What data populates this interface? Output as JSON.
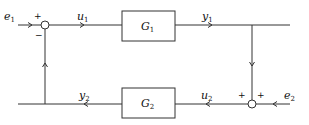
{
  "diagram": {
    "type": "feedback-loop block diagram",
    "blocks": [
      {
        "id": "G1",
        "label": "G",
        "subscript": "1"
      },
      {
        "id": "G2",
        "label": "G",
        "subscript": "2"
      }
    ],
    "signals": {
      "e1": {
        "label": "e",
        "subscript": "1"
      },
      "u1": {
        "label": "u",
        "subscript": "1"
      },
      "y1": {
        "label": "y",
        "subscript": "1"
      },
      "e2": {
        "label": "e",
        "subscript": "2"
      },
      "u2": {
        "label": "u",
        "subscript": "2"
      },
      "y2": {
        "label": "y",
        "subscript": "2"
      }
    },
    "junctions": {
      "sum1": {
        "signs": {
          "e1": "+",
          "feedback": "−"
        }
      },
      "sum2": {
        "signs": {
          "y1": "+",
          "e2": "+"
        }
      }
    },
    "colors": {
      "line": "#333333",
      "text": "#111111",
      "background": "#ffffff"
    }
  }
}
